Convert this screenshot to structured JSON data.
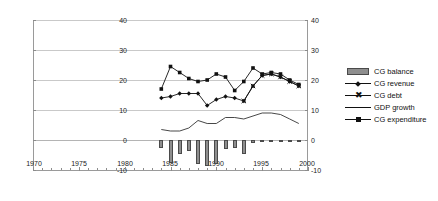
{
  "chart_data": {
    "type": "line",
    "title": "",
    "subtitle": "",
    "xlabel": "",
    "ylabel": "",
    "xlim": [
      1970,
      2000
    ],
    "ylim": [
      -10,
      40
    ],
    "xticks": [
      1970,
      1975,
      1980,
      1985,
      1990,
      1995,
      2000
    ],
    "yticks": [
      -10,
      0,
      10,
      20,
      30,
      40
    ],
    "y_axis_right": {
      "ticks": [
        -10,
        0,
        10,
        20,
        30,
        40
      ],
      "lim": [
        -10,
        40
      ]
    },
    "grid": true,
    "grid_axis": "y",
    "legend_position": "right",
    "x": [
      1984,
      1985,
      1986,
      1987,
      1988,
      1989,
      1990,
      1991,
      1992,
      1993,
      1994,
      1995,
      1996,
      1997,
      1998,
      1999
    ],
    "series": [
      {
        "name": "CG balance",
        "type": "bar",
        "color": "#8e8e8e",
        "values": [
          -2.5,
          -7.5,
          -4.5,
          -3.5,
          -8.0,
          -8.5,
          -8.0,
          -3.0,
          -2.5,
          -4.5,
          -1.0,
          -0.5,
          -0.4,
          -0.5,
          -0.6,
          -0.5
        ]
      },
      {
        "name": "CG revenue",
        "type": "line",
        "marker": "diamond",
        "color": "#111111",
        "values": [
          14.0,
          14.5,
          15.5,
          15.5,
          15.5,
          11.5,
          13.5,
          14.5,
          14.0,
          13.0,
          18.0,
          21.5,
          22.0,
          21.0,
          19.5,
          18.0
        ]
      },
      {
        "name": "CG debt",
        "type": "line",
        "marker": "cross",
        "color": "#111111",
        "values": [
          null,
          null,
          null,
          null,
          null,
          null,
          null,
          null,
          null,
          13.0,
          18.0,
          21.5,
          22.0,
          21.0,
          19.5,
          18.0
        ]
      },
      {
        "name": "GDP growth",
        "type": "line",
        "marker": "none",
        "color": "#333333",
        "values": [
          3.5,
          3.0,
          3.0,
          4.0,
          6.5,
          5.5,
          5.5,
          7.5,
          7.5,
          7.0,
          8.0,
          9.0,
          9.0,
          8.5,
          7.0,
          5.5
        ]
      },
      {
        "name": "CG expenditure",
        "type": "line",
        "marker": "square",
        "color": "#111111",
        "values": [
          17.0,
          24.5,
          22.5,
          20.5,
          19.5,
          20.0,
          22.0,
          21.0,
          16.5,
          19.5,
          24.0,
          22.0,
          22.5,
          22.0,
          20.0,
          18.5
        ]
      }
    ]
  },
  "legend": {
    "items": [
      {
        "label": "CG balance",
        "key": "bar-swatch"
      },
      {
        "label": "CG revenue",
        "key": "line-diamond"
      },
      {
        "label": "CG debt",
        "key": "line-cross"
      },
      {
        "label": "GDP growth",
        "key": "line-plain"
      },
      {
        "label": "CG expenditure",
        "key": "line-square"
      }
    ]
  },
  "axes": {
    "left_labels": [
      "40",
      "30",
      "20",
      "10",
      "0",
      "-10"
    ],
    "right_labels": [
      "40",
      "30",
      "20",
      "10",
      "0",
      "-10"
    ],
    "x_labels": [
      "1970",
      "1975",
      "1980",
      "1985",
      "1990",
      "1995",
      "2000"
    ]
  },
  "colors": {
    "bar_fill": "#8e8e8e",
    "bar_stroke": "#4a4a4a",
    "line": "#111111",
    "grid": "#c9c9c9",
    "axis": "#9a9a9a",
    "text": "#1a1a1a"
  }
}
